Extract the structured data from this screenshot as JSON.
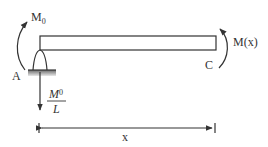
{
  "diagram": {
    "type": "free-body beam diagram",
    "labels": {
      "applied_moment": "M",
      "applied_moment_sub": "0",
      "reaction_num": "M",
      "reaction_num_sub": "0",
      "reaction_den": "L",
      "left_point": "A",
      "right_point": "C",
      "internal_moment": "M(x)",
      "distance": "x"
    },
    "colors": {
      "line": "#333333",
      "ground": "#9a9a9a",
      "background": "#ffffff"
    }
  }
}
